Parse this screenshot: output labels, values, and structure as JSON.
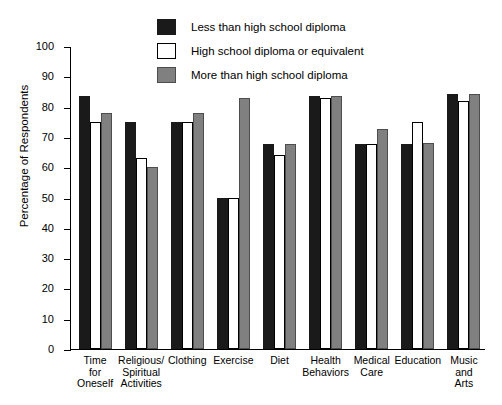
{
  "chart_data": {
    "type": "bar",
    "title": "",
    "xlabel": "",
    "ylabel": "Percentage of Respondents",
    "ylim": [
      0,
      100
    ],
    "ytick_step": 10,
    "yticks": [
      100,
      90,
      80,
      70,
      60,
      50,
      40,
      30,
      20,
      10,
      0
    ],
    "grid": false,
    "legend_position": "top-center",
    "categories": [
      "Time\nfor\nOneself",
      "Religious/\nSpiritual\nActivities",
      "Clothing",
      "Exercise",
      "Diet",
      "Health\nBehaviors",
      "Medical\nCare",
      "Education",
      "Music\nand\nArts"
    ],
    "series": [
      {
        "name": "Less than high school diploma",
        "color": "#1a1a1a",
        "values": [
          83.5,
          75.0,
          75.0,
          50.0,
          67.5,
          83.5,
          67.5,
          67.5,
          84.0
        ]
      },
      {
        "name": "High school diploma or equivalent",
        "color": "#ffffff",
        "values": [
          75.0,
          63.0,
          75.0,
          50.0,
          64.0,
          83.0,
          67.5,
          75.0,
          82.0
        ]
      },
      {
        "name": "More than high school diploma",
        "color": "#808080",
        "values": [
          78.0,
          60.0,
          78.0,
          83.0,
          67.5,
          83.5,
          72.5,
          68.0,
          84.0
        ]
      }
    ]
  },
  "legend": {
    "items": [
      {
        "label": "Less than high school diploma",
        "swatch": "black-swatch"
      },
      {
        "label": "High school diploma or equivalent",
        "swatch": "white-swatch"
      },
      {
        "label": "More than high school diploma",
        "swatch": "gray-swatch"
      }
    ]
  },
  "axes": {
    "y_title": "Percentage of Respondents"
  }
}
